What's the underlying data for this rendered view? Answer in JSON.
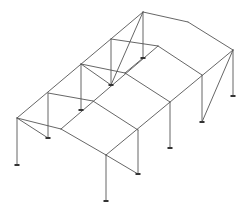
{
  "diagram": {
    "type": "3d-structural-frame-wireframe",
    "colors": {
      "background": "#ffffff",
      "member": "#555555",
      "support": "#333333"
    },
    "nodes": {
      "A_top": [
        17,
        118
      ],
      "A_base": [
        17,
        165
      ],
      "B_top": [
        48,
        93
      ],
      "B_base": [
        48,
        138
      ],
      "C_top": [
        81,
        64
      ],
      "C_base": [
        81,
        110
      ],
      "D_top": [
        111,
        39
      ],
      "D_base": [
        111,
        85
      ],
      "E_top": [
        143,
        12
      ],
      "E_base": [
        143,
        58
      ],
      "F_mid": [
        61,
        129
      ],
      "G_mid": [
        93,
        101
      ],
      "H_mid": [
        125,
        73
      ],
      "I_mid": [
        158,
        46
      ],
      "J_top": [
        106,
        155
      ],
      "J_base": [
        106,
        201
      ],
      "K_top": [
        138,
        130
      ],
      "K_base": [
        138,
        174
      ],
      "L_top": [
        170,
        102
      ],
      "L_base": [
        170,
        148
      ],
      "M_top": [
        202,
        75
      ],
      "M_base": [
        202,
        122
      ],
      "N_top": [
        233,
        50
      ],
      "N_base": [
        233,
        96
      ],
      "O_mid": [
        188,
        22
      ]
    },
    "members": [
      [
        "A_top",
        "A_base"
      ],
      [
        "B_top",
        "B_base"
      ],
      [
        "C_top",
        "C_base"
      ],
      [
        "D_top",
        "D_base"
      ],
      [
        "E_top",
        "E_base"
      ],
      [
        "J_top",
        "J_base"
      ],
      [
        "K_top",
        "K_base"
      ],
      [
        "L_top",
        "L_base"
      ],
      [
        "M_top",
        "M_base"
      ],
      [
        "N_top",
        "N_base"
      ],
      [
        "A_top",
        "E_top"
      ],
      [
        "F_mid",
        "I_mid"
      ],
      [
        "J_top",
        "N_top"
      ],
      [
        "A_top",
        "F_mid"
      ],
      [
        "F_mid",
        "J_top"
      ],
      [
        "B_top",
        "G_mid"
      ],
      [
        "G_mid",
        "K_top"
      ],
      [
        "C_top",
        "H_mid"
      ],
      [
        "H_mid",
        "L_top"
      ],
      [
        "D_top",
        "I_mid"
      ],
      [
        "I_mid",
        "M_top"
      ],
      [
        "E_top",
        "O_mid"
      ],
      [
        "O_mid",
        "N_top"
      ],
      [
        "A_top",
        "B_base"
      ],
      [
        "J_top",
        "K_base"
      ],
      [
        "C_top",
        "D_base"
      ],
      [
        "D_base",
        "E_top"
      ],
      [
        "N_top",
        "M_base"
      ],
      [
        "H_mid",
        "E_base"
      ]
    ],
    "supports": [
      "A_base",
      "B_base",
      "C_base",
      "D_base",
      "E_base",
      "J_base",
      "K_base",
      "L_base",
      "M_base",
      "N_base"
    ]
  }
}
